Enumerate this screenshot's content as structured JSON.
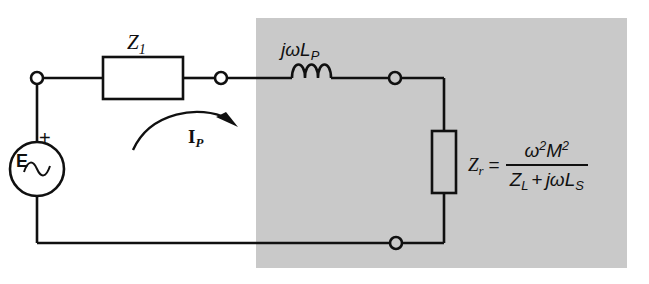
{
  "diagram": {
    "background_color": "#ffffff",
    "shaded_region_color": "#c9c9c9",
    "line_color": "#101010"
  },
  "labels": {
    "source_label": "E",
    "source_polarity": "+",
    "source_type": "ac-sine",
    "series_impedance": "Z",
    "series_impedance_sub": "1",
    "inductor_j": "j",
    "inductor_omega": "ω",
    "inductor_L": "L",
    "inductor_sub": "P",
    "mesh_current": "I",
    "mesh_current_sub": "P"
  },
  "formula": {
    "lhs": "Z",
    "lhs_sub": "r",
    "equals": "=",
    "numerator_omega": "ω",
    "numerator_omega_exp": "2",
    "numerator_M": "M",
    "numerator_M_exp": "2",
    "denominator_Z": "Z",
    "denominator_Z_sub": "L",
    "denominator_plus": "+",
    "denominator_j": "j",
    "denominator_omega": "ω",
    "denominator_L": "L",
    "denominator_L_sub": "S"
  },
  "elements": {
    "resistor_box_name": "Z1 impedance box",
    "reflected_box_name": "Zr reflected impedance box",
    "terminal_count": 4,
    "inductor_coils": 3
  }
}
